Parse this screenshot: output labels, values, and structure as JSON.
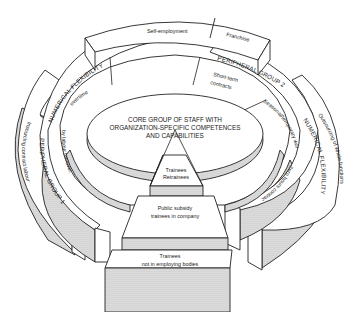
{
  "diagram": {
    "core": {
      "line1": "CORE GROUP OF STAFF WITH",
      "line2": "ORGANIZATION-SPECIFIC COMPETENCES",
      "line3": "AND CAPABILITIES"
    },
    "top_segments": {
      "self_employment": "Self-employment",
      "franchise": "Franchise"
    },
    "peripheral_group_1": {
      "label": "PERIPHERAL GROUP 1",
      "band": "NUMERICAL FLEXIBILITY",
      "items": [
        "overtime",
        "by labour turnover,"
      ]
    },
    "peripheral_group_2": {
      "label": "PERIPHERAL GROUP 2",
      "band": "NUMERICAL FLEXIBILITY",
      "items": [
        "Short-term contracts",
        "Seasonal/temporary workers",
        "Zero hours contracts etc."
      ]
    },
    "outer_left": "Insourcing contract labour",
    "outer_right": "Outsourcing of whole functions",
    "front_stack": {
      "top": [
        "Trainees",
        "Retrainees"
      ],
      "middle": [
        "Public subsidy",
        "trainees in company"
      ],
      "bottom": [
        "Trainees",
        "not in employing bodies"
      ]
    }
  }
}
